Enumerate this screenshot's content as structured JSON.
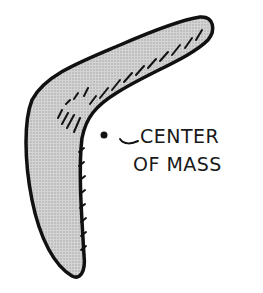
{
  "figure": {
    "annotation": {
      "line1": "CENTER",
      "line2": "OF MASS"
    },
    "colors": {
      "outline": "#111111",
      "fill": "#c8c8c8",
      "hatch": "#1a1a1a",
      "background": "#ffffff"
    }
  }
}
